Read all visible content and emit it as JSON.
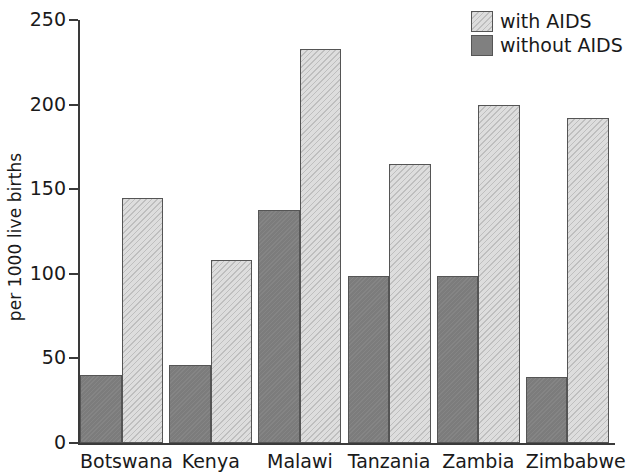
{
  "chart_data": {
    "type": "bar",
    "title": "",
    "subtitle": "",
    "xlabel": "",
    "ylabel": "per 1000 live births",
    "categories": [
      "Botswana",
      "Kenya",
      "Malawi",
      "Tanzania",
      "Zambia",
      "Zimbabwe"
    ],
    "series": [
      {
        "name": "without AIDS",
        "color": "#808080",
        "values": [
          40,
          46,
          138,
          99,
          99,
          39
        ]
      },
      {
        "name": "with AIDS",
        "color": "#dddddd",
        "values": [
          145,
          108,
          233,
          165,
          200,
          192
        ]
      }
    ],
    "series_order_in_group": [
      "without AIDS",
      "with AIDS"
    ],
    "ylim": [
      0,
      250
    ],
    "yticks": [
      0,
      50,
      100,
      150,
      200,
      250
    ],
    "ytick_labels": [
      "0",
      "50",
      "100",
      "150",
      "200",
      "250"
    ],
    "grid": false,
    "legend_position": "top-right",
    "legend_entries": [
      "with AIDS",
      "without AIDS"
    ]
  },
  "axes": {
    "y_axis_label": "per 1000 live births",
    "y_tick_labels": [
      "250",
      "200",
      "150",
      "100",
      "50",
      "0"
    ]
  },
  "legend": {
    "items": [
      {
        "label": "with AIDS",
        "swatch": "light-hatched-swatch"
      },
      {
        "label": "without AIDS",
        "swatch": "dark-gray-swatch"
      }
    ]
  },
  "x_axis": {
    "labels": [
      "Botswana",
      "Kenya",
      "Malawi",
      "Tanzania",
      "Zambia",
      "Zimbabwe"
    ]
  },
  "colors": {
    "with_aids": "#dddddd",
    "without_aids": "#808080",
    "axis": "#3a3a3a",
    "bar_border": "#555555",
    "text": "#1a1a1a",
    "background": "#ffffff"
  }
}
